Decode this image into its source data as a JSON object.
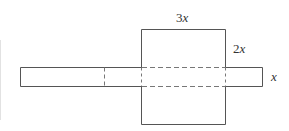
{
  "diagram": {
    "labels": {
      "top": {
        "coef": "3",
        "var": "x"
      },
      "right_upper": {
        "coef": "2",
        "var": "x"
      },
      "right_strip": {
        "coef": "",
        "var": "x"
      }
    },
    "colors": {
      "stroke": "#555555",
      "dashed": "#777777",
      "text": "#333333",
      "background": "#ffffff"
    }
  }
}
